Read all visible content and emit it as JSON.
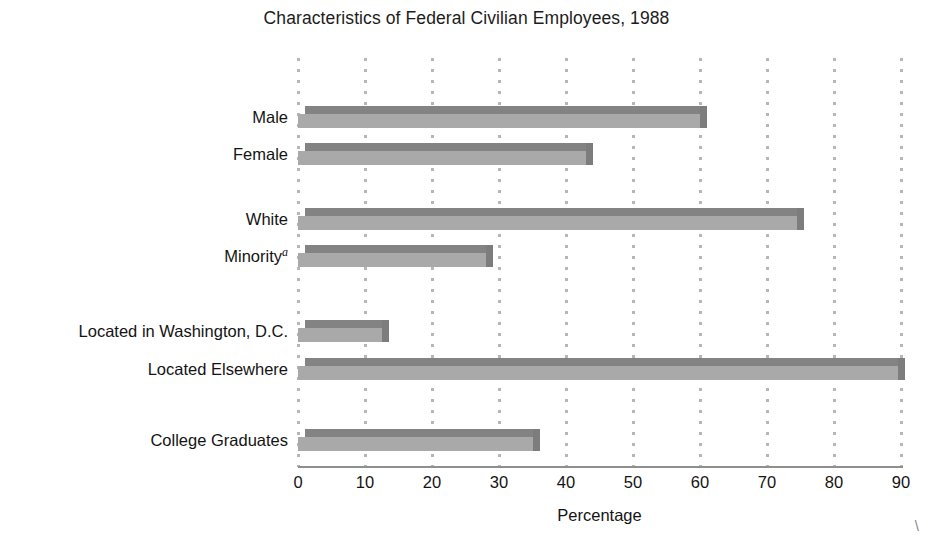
{
  "chart_data": {
    "type": "bar",
    "orientation": "horizontal",
    "title": "Characteristics of Federal Civilian Employees, 1988",
    "xlabel": "Percentage",
    "ylabel": "",
    "xlim": [
      0,
      90
    ],
    "xticks": [
      0,
      10,
      20,
      30,
      40,
      50,
      60,
      70,
      80,
      90
    ],
    "xtick_labels": [
      "0",
      "10",
      "20",
      "30",
      "40",
      "50",
      "60",
      "70",
      "80",
      "90"
    ],
    "grid": "vertical dotted gridlines at every x tick",
    "legend": "none",
    "categories": [
      "Male",
      "Female",
      "White",
      "Minority",
      "Located in Washington, D.C.",
      "Located Elsewhere",
      "College Graduates"
    ],
    "values": [
      60,
      43,
      74.5,
      28,
      12.5,
      89.5,
      35
    ],
    "footnote_marker": "a",
    "footnote_on": "Minority",
    "bar_color": "#a9a9a9",
    "bar_top_color": "#838383",
    "gridline_color": "#b6b6b6",
    "axis_color": "#8f8f8f"
  },
  "rows": [
    {
      "label": "Male",
      "value": 60,
      "sup": "",
      "top": 48
    },
    {
      "label": "Female",
      "value": 43,
      "sup": "",
      "top": 85
    },
    {
      "label": "White",
      "value": 74.5,
      "sup": "",
      "top": 150
    },
    {
      "label": "Minority",
      "value": 28,
      "sup": "a",
      "top": 187
    },
    {
      "label": "Located in Washington, D.C.",
      "value": 12.5,
      "sup": "",
      "top": 262
    },
    {
      "label": "Located Elsewhere",
      "value": 89.5,
      "sup": "",
      "top": 300
    },
    {
      "label": "College Graduates",
      "value": 35,
      "sup": "",
      "top": 371
    }
  ],
  "corner_mark": "\\"
}
